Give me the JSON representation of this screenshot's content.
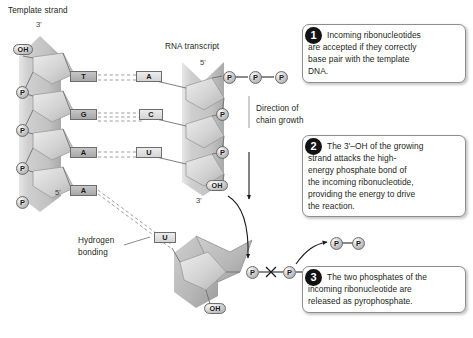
{
  "figure": {
    "title_labels": {
      "template_strand": "Template strand",
      "rna_transcript": "RNA transcript",
      "direction_line1": "Direction of",
      "direction_line2": "chain growth",
      "hydrogen_line1": "Hydrogen",
      "hydrogen_line2": "bonding"
    },
    "template_strand": {
      "end_label_top": "3'",
      "end_label_bottom": "5'",
      "terminal_hydroxyl": "OH",
      "phosphates": [
        "P",
        "P",
        "P",
        "P"
      ],
      "bases": [
        "T",
        "G",
        "A",
        "A"
      ]
    },
    "rna_transcript": {
      "end_label_top": "5'",
      "end_label_bottom": "3'",
      "triphosphate": [
        "P",
        "P",
        "P"
      ],
      "phosphates": [
        "P",
        "P"
      ],
      "bases": [
        "A",
        "C",
        "U"
      ],
      "terminal_hydroxyl": "OH"
    },
    "incoming_nucleotide": {
      "base": "U",
      "phosphates": [
        "P",
        "P",
        "P"
      ],
      "hydroxyl": "OH",
      "bond_break_marker": "X"
    },
    "pyrophosphate": {
      "phosphates": [
        "P",
        "P"
      ]
    },
    "callouts": [
      {
        "number": "1",
        "lines": [
          "Incoming ribonucleotides",
          "are accepted if they correctly",
          "base pair with the template",
          "DNA."
        ]
      },
      {
        "number": "2",
        "lines": [
          "The 3'–OH of the growing",
          "strand attacks the high-",
          "energy phosphate bond of",
          "the incoming ribonucleotide,",
          "providing the energy to drive",
          "the reaction."
        ]
      },
      {
        "number": "3",
        "lines": [
          "The two phosphates of the",
          "incoming ribonucleotide are",
          "released as pyrophosphate."
        ]
      }
    ],
    "colors": {
      "background": "#ffffff",
      "text": "#231f20",
      "backbone_gray": "#c9c9c9",
      "sugar_gray": "#b5b5b5",
      "badge_black": "#121212",
      "outline": "#6d6d6d"
    }
  }
}
